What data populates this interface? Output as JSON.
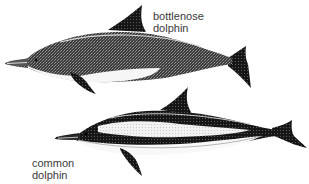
{
  "illustration": {
    "subject": "dolphin species comparison",
    "colors": {
      "background": "#ffffff",
      "ink_dark": "#1a1a1a",
      "ink_mid": "#4a4a4a",
      "belly": "#f4f4f4",
      "label_text": "#3a3a3a"
    },
    "dolphins": [
      {
        "id": "bottlenose",
        "label_line1": "bottlenose",
        "label_line2": "dolphin"
      },
      {
        "id": "common",
        "label_line1": "common",
        "label_line2": "dolphin"
      }
    ]
  }
}
